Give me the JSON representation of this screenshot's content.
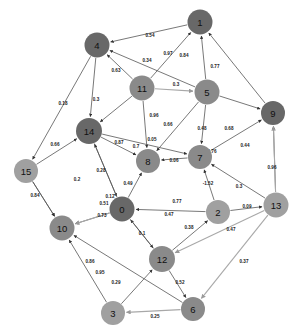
{
  "figure": {
    "type": "directed-network-graph",
    "background_color": "#ffffff",
    "width": 304,
    "height": 335
  },
  "chart_data": {
    "type": "diagram",
    "subtype": "directed-weighted-graph",
    "title": "",
    "xlabel": "",
    "ylabel": "",
    "grid": false,
    "legend": "none",
    "node_colors": {
      "dark": "#686868",
      "medium": "#8a8a8a",
      "light": "#a0a0a0"
    },
    "edge_color": "#555555",
    "edge_color_light": "#a8a8a8",
    "nodes": [
      {
        "id": "1",
        "x": 200,
        "y": 22,
        "r": 12.5,
        "shade": "dark"
      },
      {
        "id": "4",
        "x": 97,
        "y": 45,
        "r": 12.5,
        "shade": "dark"
      },
      {
        "id": "11",
        "x": 142,
        "y": 88,
        "r": 12.5,
        "shade": "medium"
      },
      {
        "id": "5",
        "x": 207,
        "y": 92,
        "r": 12.5,
        "shade": "medium"
      },
      {
        "id": "9",
        "x": 273,
        "y": 113,
        "r": 12.0,
        "shade": "dark"
      },
      {
        "id": "14",
        "x": 89,
        "y": 131,
        "r": 13.0,
        "shade": "dark"
      },
      {
        "id": "8",
        "x": 148,
        "y": 161,
        "r": 12.0,
        "shade": "medium"
      },
      {
        "id": "7",
        "x": 200,
        "y": 157,
        "r": 12.0,
        "shade": "medium"
      },
      {
        "id": "15",
        "x": 26,
        "y": 171,
        "r": 12.0,
        "shade": "light"
      },
      {
        "id": "13",
        "x": 276,
        "y": 205,
        "r": 12.5,
        "shade": "light"
      },
      {
        "id": "0",
        "x": 122,
        "y": 209,
        "r": 12.5,
        "shade": "dark"
      },
      {
        "id": "2",
        "x": 218,
        "y": 212,
        "r": 12.0,
        "shade": "light"
      },
      {
        "id": "10",
        "x": 62,
        "y": 228,
        "r": 12.5,
        "shade": "medium"
      },
      {
        "id": "12",
        "x": 162,
        "y": 259,
        "r": 13.0,
        "shade": "medium"
      },
      {
        "id": "3",
        "x": 113,
        "y": 313,
        "r": 12.0,
        "shade": "light"
      },
      {
        "id": "6",
        "x": 193,
        "y": 309,
        "r": 12.0,
        "shade": "medium"
      }
    ],
    "edges": [
      {
        "from": "1",
        "to": "4",
        "weight": "0.54",
        "lx": 150,
        "ly": 37,
        "light": false
      },
      {
        "from": "11",
        "to": "1",
        "weight": "0.97",
        "lx": 168,
        "ly": 55,
        "light": false
      },
      {
        "from": "5",
        "to": "1",
        "weight": "0.84",
        "lx": 184,
        "ly": 57,
        "light": false
      },
      {
        "from": "9",
        "to": "1",
        "weight": "0.77",
        "lx": 215,
        "ly": 68,
        "light": false
      },
      {
        "from": "11",
        "to": "4",
        "weight": "0.34",
        "lx": 147,
        "ly": 62,
        "light": false
      },
      {
        "from": "5",
        "to": "4",
        "weight": "0.63",
        "lx": 116,
        "ly": 72,
        "light": false
      },
      {
        "from": "11",
        "to": "5",
        "weight": "0.3",
        "lx": 176,
        "ly": 86,
        "light": true
      },
      {
        "from": "4",
        "to": "14",
        "weight": "0.3",
        "lx": 96,
        "ly": 101,
        "light": false
      },
      {
        "from": "4",
        "to": "15",
        "weight": "0.18",
        "lx": 63,
        "ly": 105,
        "light": false
      },
      {
        "from": "11",
        "to": "14",
        "weight": "0.96",
        "lx": 154,
        "ly": 117,
        "light": false
      },
      {
        "from": "5",
        "to": "8",
        "weight": "0.66",
        "lx": 168,
        "ly": 126,
        "light": false
      },
      {
        "from": "5",
        "to": "7",
        "weight": "0.48",
        "lx": 202,
        "ly": 130,
        "light": false
      },
      {
        "from": "5",
        "to": "9",
        "weight": "0.68",
        "lx": 229,
        "ly": 130,
        "light": false
      },
      {
        "from": "15",
        "to": "14",
        "weight": "0.66",
        "lx": 55,
        "ly": 146,
        "light": false
      },
      {
        "from": "14",
        "to": "8",
        "weight": "0.87",
        "lx": 119,
        "ly": 144,
        "light": false
      },
      {
        "from": "11",
        "to": "8",
        "weight": "0.7",
        "lx": 136,
        "ly": 148,
        "light": false
      },
      {
        "from": "14",
        "to": "7",
        "weight": "0.05",
        "lx": 152,
        "ly": 141,
        "light": false
      },
      {
        "from": "7",
        "to": "8",
        "weight": "0.06",
        "lx": 174,
        "ly": 162,
        "light": false
      },
      {
        "from": "7",
        "to": "9",
        "weight": "0.76",
        "lx": 212,
        "ly": 153,
        "light": false
      },
      {
        "from": "13",
        "to": "9",
        "weight": "0.44",
        "lx": 245,
        "ly": 147,
        "light": false
      },
      {
        "from": "13",
        "to": "9",
        "weight": "0.96",
        "lx": 272,
        "ly": 169,
        "light": true
      },
      {
        "from": "14",
        "to": "0",
        "weight": "0.28",
        "lx": 101,
        "ly": 172,
        "light": false
      },
      {
        "from": "15",
        "to": "10",
        "weight": "0.2",
        "lx": 77,
        "ly": 181,
        "light": false
      },
      {
        "from": "15",
        "to": "10",
        "weight": "0.84",
        "lx": 35,
        "ly": 197,
        "light": false
      },
      {
        "from": "0",
        "to": "8",
        "weight": "0.49",
        "lx": 128,
        "ly": 185,
        "light": false
      },
      {
        "from": "0",
        "to": "14",
        "weight": "0.12",
        "lx": 110,
        "ly": 198,
        "light": false
      },
      {
        "from": "0",
        "to": "10",
        "weight": "0.51",
        "lx": 104,
        "ly": 205,
        "light": false
      },
      {
        "from": "2",
        "to": "7",
        "weight": "-1.52",
        "lx": 208,
        "ly": 185,
        "light": false
      },
      {
        "from": "13",
        "to": "7",
        "weight": "0.3",
        "lx": 239,
        "ly": 188,
        "light": false
      },
      {
        "from": "2",
        "to": "13",
        "weight": "0.09",
        "lx": 247,
        "ly": 208,
        "light": false
      },
      {
        "from": "2",
        "to": "0",
        "weight": "0.77",
        "lx": 177,
        "ly": 203,
        "light": false
      },
      {
        "from": "12",
        "to": "0",
        "weight": "0.47",
        "lx": 169,
        "ly": 216,
        "light": false
      },
      {
        "from": "0",
        "to": "12",
        "weight": "0.1",
        "lx": 142,
        "ly": 235,
        "light": false
      },
      {
        "from": "12",
        "to": "2",
        "weight": "0.38",
        "lx": 189,
        "ly": 229,
        "light": false
      },
      {
        "from": "13",
        "to": "12",
        "weight": "0.47",
        "lx": 231,
        "ly": 231,
        "light": true
      },
      {
        "from": "0",
        "to": "10",
        "weight": "0.73",
        "lx": 102,
        "ly": 217,
        "light": true
      },
      {
        "from": "3",
        "to": "10",
        "weight": "0.86",
        "lx": 90,
        "ly": 263,
        "light": false
      },
      {
        "from": "6",
        "to": "10",
        "weight": "0.95",
        "lx": 100,
        "ly": 274,
        "light": false
      },
      {
        "from": "3",
        "to": "12",
        "weight": "0.29",
        "lx": 116,
        "ly": 284,
        "light": false
      },
      {
        "from": "12",
        "to": "6",
        "weight": "0.52",
        "lx": 180,
        "ly": 284,
        "light": false
      },
      {
        "from": "6",
        "to": "3",
        "weight": "0.25",
        "lx": 155,
        "ly": 318,
        "light": true
      },
      {
        "from": "13",
        "to": "6",
        "weight": "0.37",
        "lx": 244,
        "ly": 263,
        "light": true
      }
    ]
  }
}
